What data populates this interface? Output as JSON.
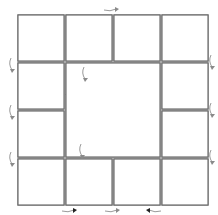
{
  "puzzle": {
    "title": "Rotating tile puzzle",
    "grid_size": 4,
    "colors": {
      "tile_fill": "#ffffff",
      "shade_fill": "#ededed",
      "border": "#6e6e6e",
      "diagonal": "#4a4a4a",
      "arrow_light": "#8a8a8a",
      "arrow_dark": "#222222"
    },
    "tiles": [
      {
        "row": 0,
        "col": 0,
        "diagonal": "/",
        "shaded": "upper-left"
      },
      {
        "row": 0,
        "col": 1,
        "diagonal": "/",
        "shaded": "lower-right"
      },
      {
        "row": 0,
        "col": 2,
        "diagonal": "\\",
        "shaded": "lower-left"
      },
      {
        "row": 0,
        "col": 3,
        "diagonal": "\\",
        "shaded": "upper-right"
      },
      {
        "row": 1,
        "col": 0,
        "diagonal": "/",
        "shaded": "lower-right"
      },
      {
        "row": 1,
        "col": 3,
        "diagonal": "\\",
        "shaded": "lower-left"
      },
      {
        "row": 2,
        "col": 0,
        "diagonal": "\\",
        "shaded": "upper-right"
      },
      {
        "row": 2,
        "col": 3,
        "diagonal": "/",
        "shaded": "lower-right"
      },
      {
        "row": 3,
        "col": 0,
        "diagonal": "\\",
        "shaded": "lower-left"
      },
      {
        "row": 3,
        "col": 1,
        "diagonal": "\\",
        "shaded": "upper-right"
      },
      {
        "row": 3,
        "col": 2,
        "diagonal": "/",
        "shaded": "upper-left"
      },
      {
        "row": 3,
        "col": 3,
        "diagonal": "/",
        "shaded": "lower-right"
      }
    ],
    "center_block": {
      "pattern": "pinwheel",
      "subgrid": 3,
      "rotatable": true
    },
    "arrows": [
      {
        "position": "top",
        "direction": "clockwise"
      },
      {
        "position": "left-1",
        "direction": "down"
      },
      {
        "position": "left-2",
        "direction": "down"
      },
      {
        "position": "left-3",
        "direction": "down"
      },
      {
        "position": "right-1",
        "direction": "down"
      },
      {
        "position": "right-2",
        "direction": "down"
      },
      {
        "position": "right-3",
        "direction": "down"
      },
      {
        "position": "bottom-1",
        "direction": "right"
      },
      {
        "position": "bottom-2",
        "direction": "right"
      },
      {
        "position": "bottom-3",
        "direction": "left"
      },
      {
        "position": "center-top",
        "direction": "down"
      },
      {
        "position": "center-bottom",
        "direction": "down"
      }
    ]
  }
}
